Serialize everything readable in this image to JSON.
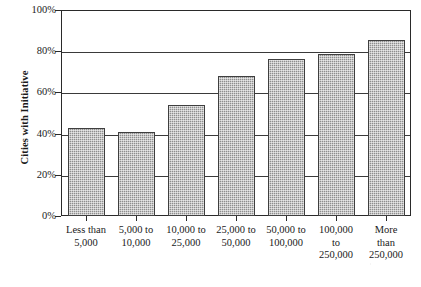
{
  "chart_data": {
    "type": "bar",
    "title": "",
    "xlabel": "",
    "ylabel": "Cities with Initiative",
    "categories": [
      "Less than 5,000",
      "5,000 to 10,000",
      "10,000 to 25,000",
      "25,000 to 50,000",
      "50,000 to 100,000",
      "100,000 to 250,000",
      "More than 250,000"
    ],
    "category_lines": [
      [
        "Less than",
        "5,000"
      ],
      [
        "5,000 to",
        "10,000"
      ],
      [
        "10,000 to",
        "25,000"
      ],
      [
        "25,000 to",
        "50,000"
      ],
      [
        "50,000 to",
        "100,000"
      ],
      [
        "100,000",
        "to",
        "250,000"
      ],
      [
        "More",
        "than",
        "250,000"
      ]
    ],
    "values": [
      42.5,
      41,
      54,
      68,
      76,
      78.5,
      85.5
    ],
    "value_labels": [
      "42.5%",
      "41%",
      "54%",
      "68%",
      "76%",
      "78.5%",
      "85.5%"
    ],
    "ylim": [
      0,
      100
    ],
    "yticks": [
      0,
      20,
      40,
      60,
      80,
      100
    ],
    "ytick_labels": [
      "0%",
      "20%",
      "40%",
      "60%",
      "80%",
      "100%"
    ],
    "grid": true,
    "grid_axis": "y",
    "legend": null,
    "bar_fill_color": "#8e8e8e",
    "bar_edge_color": "#3f3f3f",
    "axis_color": "#2a2a2a",
    "background_color": "#ffffff"
  }
}
